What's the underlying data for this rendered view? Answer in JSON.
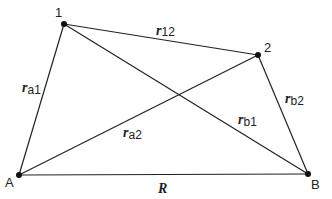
{
  "diagram": {
    "points": [
      {
        "id": "1",
        "label": "1",
        "x": 64,
        "y": 24
      },
      {
        "id": "2",
        "label": "2",
        "x": 258,
        "y": 55
      },
      {
        "id": "A",
        "label": "A",
        "x": 19,
        "y": 175
      },
      {
        "id": "B",
        "label": "B",
        "x": 308,
        "y": 174
      }
    ],
    "edges": [
      {
        "from": "1",
        "to": "2",
        "label_main": "r",
        "label_sub": "12"
      },
      {
        "from": "A",
        "to": "1",
        "label_main": "r",
        "label_sub": "a1"
      },
      {
        "from": "A",
        "to": "2",
        "label_main": "r",
        "label_sub": "a2"
      },
      {
        "from": "1",
        "to": "B",
        "label_main": "r",
        "label_sub": "b1"
      },
      {
        "from": "2",
        "to": "B",
        "label_main": "r",
        "label_sub": "b2"
      },
      {
        "from": "A",
        "to": "B",
        "label_main": "R",
        "label_sub": ""
      }
    ],
    "labels": {
      "p1": "1",
      "p2": "2",
      "pA": "A",
      "pB": "B",
      "r": "r",
      "r12_sub": "12",
      "ra1_sub": "a1",
      "ra2_sub": "a2",
      "rb1_sub": "b1",
      "rb2_sub": "b2",
      "R": "R"
    }
  }
}
